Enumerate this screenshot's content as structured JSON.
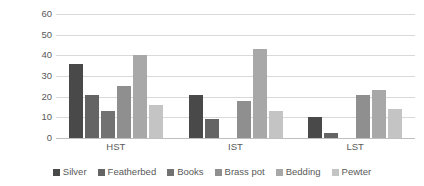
{
  "chart_data": {
    "type": "bar",
    "title": "",
    "subtitle": "",
    "xlabel": "",
    "ylabel": "% of Wills Referring to Item",
    "categories": [
      "HST",
      "IST",
      "LST"
    ],
    "series": [
      {
        "name": "Silver",
        "color": "#494949",
        "values": [
          36,
          21,
          10
        ]
      },
      {
        "name": "Featherbed",
        "color": "#646464",
        "values": [
          21,
          9,
          2.5
        ]
      },
      {
        "name": "Books",
        "color": "#727272",
        "values": [
          13,
          0,
          0
        ]
      },
      {
        "name": "Brass pot",
        "color": "#8f8f8f",
        "values": [
          25,
          18,
          21
        ]
      },
      {
        "name": "Bedding",
        "color": "#a8a8a8",
        "values": [
          40,
          43,
          23
        ]
      },
      {
        "name": "Pewter",
        "color": "#c4c4c4",
        "values": [
          16,
          13,
          14
        ]
      }
    ],
    "ylim": [
      0,
      60
    ],
    "yticks": [
      60,
      50,
      40,
      30,
      20,
      10,
      0
    ],
    "ytick_labels": [
      "60",
      "50",
      "40",
      "30",
      "20",
      "10",
      "0"
    ],
    "grid": true,
    "grid_axis": "y",
    "legend_position": "bottom",
    "gridline_color": "#d9d9d9",
    "axis_text_color": "#595959",
    "background": "#ffffff"
  }
}
